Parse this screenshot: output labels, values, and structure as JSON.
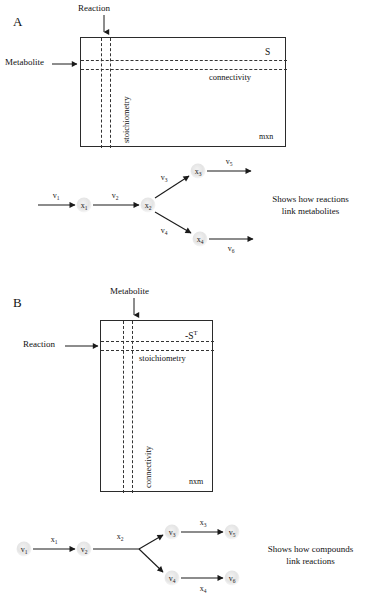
{
  "figure": {
    "background": "#ffffff",
    "ink": "#1a1a1a",
    "node_fill": "#e8e8e8"
  },
  "panelA": {
    "letter": "A",
    "matrix": {
      "name": "S",
      "top_label": "Reaction",
      "left_label": "Metabolite",
      "column_label": "stoichiometry",
      "row_label": "connectivity",
      "dimensions": "mxn"
    },
    "network": {
      "nodes": [
        {
          "base": "x",
          "sub": "1"
        },
        {
          "base": "x",
          "sub": "2"
        },
        {
          "base": "x",
          "sub": "3"
        },
        {
          "base": "x",
          "sub": "4"
        }
      ],
      "edges": [
        {
          "base": "v",
          "sub": "1"
        },
        {
          "base": "v",
          "sub": "2"
        },
        {
          "base": "v",
          "sub": "3"
        },
        {
          "base": "v",
          "sub": "4"
        },
        {
          "base": "v",
          "sub": "5"
        },
        {
          "base": "v",
          "sub": "6"
        }
      ]
    },
    "caption_line1": "Shows how reactions",
    "caption_line2": "link metabolites"
  },
  "panelB": {
    "letter": "B",
    "matrix": {
      "name": "-S",
      "name_sup": "T",
      "top_label": "Metabolite",
      "left_label": "Reaction",
      "row_label": "stoichiometry",
      "column_label": "connectivity",
      "dimensions": "nxm"
    },
    "network": {
      "nodes": [
        {
          "base": "v",
          "sub": "1"
        },
        {
          "base": "v",
          "sub": "2"
        },
        {
          "base": "v",
          "sub": "3"
        },
        {
          "base": "v",
          "sub": "4"
        },
        {
          "base": "v",
          "sub": "5"
        },
        {
          "base": "v",
          "sub": "6"
        }
      ],
      "edges": [
        {
          "base": "x",
          "sub": "1"
        },
        {
          "base": "x",
          "sub": "2"
        },
        {
          "base": "x",
          "sub": "3"
        },
        {
          "base": "x",
          "sub": "4"
        }
      ]
    },
    "caption_line1": "Shows how compounds",
    "caption_line2": "link reactions"
  }
}
